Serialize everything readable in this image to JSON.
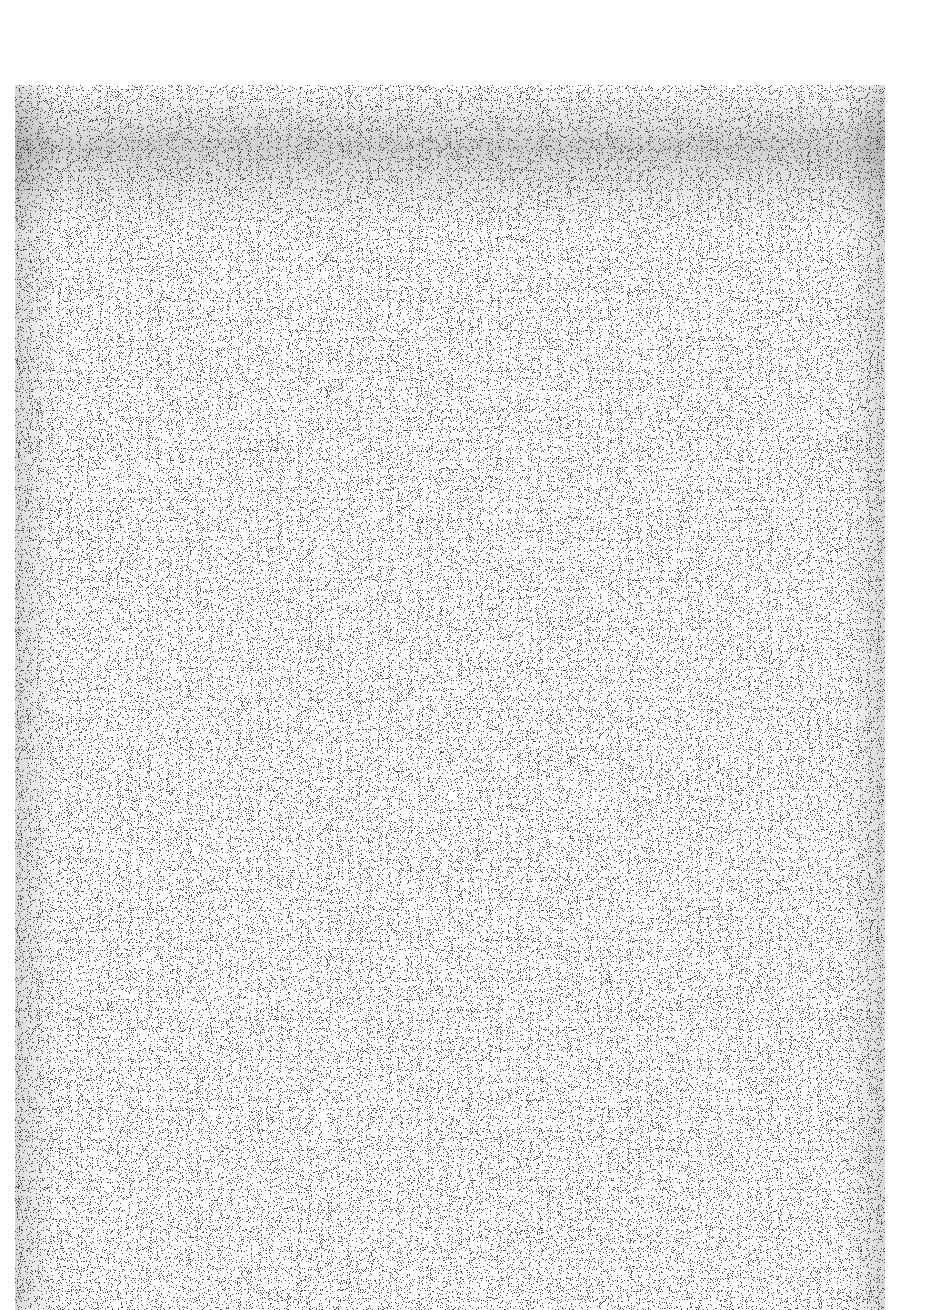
{
  "document": {
    "description": "Scanned page, content illegible (dense halftone noise)",
    "legible_text": "",
    "colors": {
      "background": "#ffffff",
      "ink": "#1a1a1a",
      "paper_tone": "#9a9a9a"
    }
  }
}
